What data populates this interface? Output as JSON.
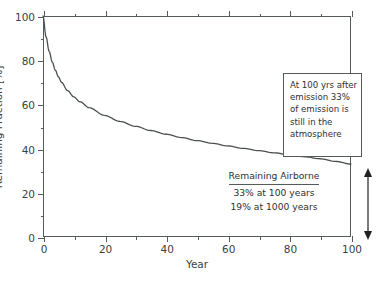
{
  "chart_data": {
    "type": "line",
    "title": "",
    "xlabel": "Year",
    "ylabel": "Remaining Fraction [%]",
    "xlim": [
      0,
      100
    ],
    "ylim": [
      0,
      100
    ],
    "grid": false,
    "legend": null,
    "xticks": [
      0,
      20,
      40,
      60,
      80,
      100
    ],
    "xtick_labels": [
      "0",
      "20",
      "40",
      "60",
      "80",
      "100"
    ],
    "xticks_minor": [
      10,
      30,
      50,
      70,
      90
    ],
    "yticks": [
      0,
      20,
      40,
      60,
      80,
      100
    ],
    "ytick_labels": [
      "0",
      "20",
      "40",
      "60",
      "80",
      "100"
    ],
    "yticks_minor": [
      10,
      30,
      50,
      70,
      90
    ],
    "series": [
      {
        "name": "Remaining airborne fraction",
        "color": "#4a4f52",
        "x": [
          0,
          1,
          2,
          3,
          4,
          5,
          6,
          8,
          10,
          12,
          15,
          20,
          25,
          30,
          35,
          40,
          45,
          50,
          55,
          60,
          65,
          70,
          75,
          80,
          85,
          90,
          95,
          100
        ],
        "y": [
          100,
          90.5,
          84.0,
          79.2,
          75.5,
          72.5,
          70.0,
          66.2,
          63.4,
          61.2,
          58.5,
          55.0,
          52.3,
          50.1,
          48.2,
          46.5,
          45.0,
          43.6,
          42.4,
          41.2,
          40.1,
          39.1,
          38.1,
          37.2,
          36.3,
          35.4,
          34.2,
          33.0
        ]
      }
    ],
    "annotations": [
      {
        "name": "callout",
        "lines": [
          "At 100 yrs after",
          "emission 33%",
          "of emission is",
          "still in the",
          "atmosphere"
        ]
      },
      {
        "name": "airborne-summary",
        "title": "Remaining Airborne",
        "lines": [
          "33% at 100 years",
          "19% at 1000 years"
        ]
      }
    ]
  },
  "axes": {
    "y_title": "Remaining Fraction [%]",
    "x_title": "Year"
  },
  "callout": {
    "line1": "At 100 yrs after",
    "line2": "emission 33%",
    "line3": "of emission is",
    "line4": "still in the",
    "line5": "atmosphere"
  },
  "airborne": {
    "title": "Remaining Airborne",
    "line1": "33% at 100 years",
    "line2": "19% at 1000 years"
  },
  "colors": {
    "axis": "#555a5c",
    "curve": "#4a4f52",
    "text": "#2d3133"
  }
}
